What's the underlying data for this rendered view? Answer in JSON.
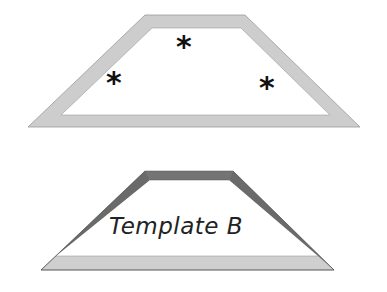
{
  "diagram": {
    "top_shape": {
      "name": "trapezoid-with-stars",
      "border_color": "#c8c8c8",
      "fill": "#ffffff",
      "markers": [
        "*",
        "*",
        "*"
      ]
    },
    "bottom_shape": {
      "name": "template-b-trapezoid",
      "label": "Template B",
      "top_band_color": "#707070",
      "side_band_color": "#6a6a6a",
      "bottom_band_color": "#cfcfcf"
    }
  }
}
